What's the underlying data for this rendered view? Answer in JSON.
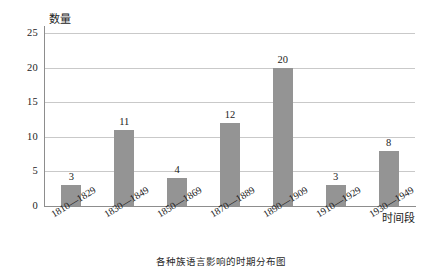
{
  "chart_data": {
    "type": "bar",
    "title": "",
    "subtitle": "",
    "xlabel": "时间段",
    "ylabel": "数量",
    "categories": [
      "1810—1829",
      "1830—1849",
      "1850—1869",
      "1870—1889",
      "1890—1909",
      "1910—1929",
      "1930—1949"
    ],
    "values": [
      3,
      11,
      4,
      12,
      20,
      3,
      8
    ],
    "data_labels": [
      "3",
      "11",
      "4",
      "12",
      "20",
      "3",
      "8"
    ],
    "ylim": [
      0,
      25
    ],
    "ytick_values": [
      0,
      5,
      10,
      15,
      20,
      25
    ],
    "ytick_labels": [
      "0",
      "5",
      "10",
      "15",
      "20",
      "25"
    ],
    "grid": "horizontal",
    "legend": "none",
    "bar_color": "#949494",
    "gridline_color": "#c9c9c9",
    "axis_color": "#8d8d8d",
    "background": "#ffffff",
    "xtick_rotation_deg": -31
  },
  "caption": {
    "text": "各种族语言影响的时期分布图"
  }
}
